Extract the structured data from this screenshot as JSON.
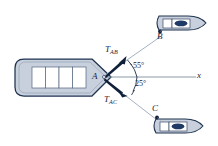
{
  "figure": {
    "background_color": "#ffffff"
  },
  "colors": {
    "hull_fill": "#c7d0dc",
    "hull_stroke": "#1f3350",
    "hull_inner_fill": "#ffffff",
    "vector_color": "#10203a",
    "tow_line_color": "#9aa8bb",
    "axis_color": "#7e8c9e",
    "window_dark": "#203a66",
    "text_color": "#1d2433"
  },
  "labels": {
    "point_a": "A",
    "point_b": "B",
    "point_c": "C",
    "axis_x": "x",
    "force_ab_base": "T",
    "force_ab_sub": "AB",
    "force_ac_base": "T",
    "force_ac_sub": "AC",
    "angle_upper": "55°",
    "angle_lower": "25°"
  },
  "geometry": {
    "point_a": {
      "x": 103,
      "y": 77
    },
    "point_b": {
      "x": 160,
      "y": 37
    },
    "point_c": {
      "x": 157,
      "y": 120
    },
    "axis_end": {
      "x": 196,
      "y": 77
    },
    "angle_upper_value": 55,
    "angle_lower_value": 25,
    "vector_ab_tip": {
      "x": 124,
      "y": 59
    },
    "vector_ac_tip": {
      "x": 126,
      "y": 94
    }
  },
  "barge": {
    "compartment_count": 4,
    "description": "Rounded rectangular barge hull with pointed bow at right and four rectangular cargo compartments"
  },
  "boats": [
    {
      "name": "boat-b",
      "attach_label": "B"
    },
    {
      "name": "boat-c",
      "attach_label": "C"
    }
  ]
}
